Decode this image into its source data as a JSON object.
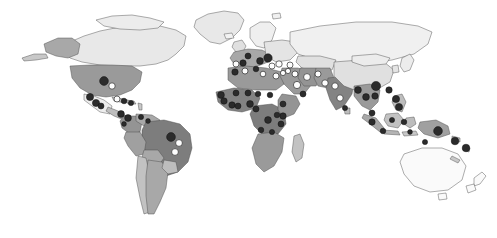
{
  "figure": {
    "type": "choropleth-world-map",
    "title": "",
    "background_color": "#ffffff",
    "width": 497,
    "height": 238,
    "projection": "equirectangular-like",
    "has_legend": false,
    "has_axis_labels": false,
    "has_title_text": false,
    "border_color": "#4a4a4a"
  },
  "chart_data": {
    "type": "map",
    "title": "",
    "xlabel": "",
    "ylabel": "",
    "legend_position": "none",
    "grid": false,
    "choropleth_scale": {
      "name": "grayscale-sequential",
      "steps": [
        {
          "level": 0,
          "label": "no data",
          "color": "#ffffff"
        },
        {
          "level": 1,
          "label": "very low",
          "color": "#e6e6e6"
        },
        {
          "level": 2,
          "label": "low",
          "color": "#d2d2d2"
        },
        {
          "level": 3,
          "label": "medium-low",
          "color": "#bdbdbd"
        },
        {
          "level": 4,
          "label": "medium",
          "color": "#a8a8a8"
        },
        {
          "level": 5,
          "label": "medium-high",
          "color": "#949494"
        },
        {
          "level": 6,
          "label": "high",
          "color": "#808080"
        },
        {
          "level": 7,
          "label": "very high",
          "color": "#6b6b6b"
        }
      ]
    },
    "marker_types": [
      {
        "name": "dark-marker",
        "fill": "#2b2b2b",
        "stroke": "#111111",
        "meaning": "recorded site"
      },
      {
        "name": "light-marker",
        "fill": "#fdfdfd",
        "stroke": "#2b2b2b",
        "meaning": "secondary site"
      }
    ],
    "regions": [
      {
        "name": "Greenland",
        "level": 1
      },
      {
        "name": "Canada",
        "level": 1
      },
      {
        "name": "Alaska",
        "level": 4
      },
      {
        "name": "United States",
        "level": 5
      },
      {
        "name": "Mexico",
        "level": 1
      },
      {
        "name": "Central America",
        "level": 3
      },
      {
        "name": "Caribbean",
        "level": 3
      },
      {
        "name": "Colombia",
        "level": 5
      },
      {
        "name": "Venezuela",
        "level": 4
      },
      {
        "name": "Brazil",
        "level": 6
      },
      {
        "name": "Peru",
        "level": 4
      },
      {
        "name": "Bolivia",
        "level": 4
      },
      {
        "name": "Chile",
        "level": 3
      },
      {
        "name": "Argentina",
        "level": 4
      },
      {
        "name": "Western Europe",
        "level": 4
      },
      {
        "name": "Eastern Europe",
        "level": 1
      },
      {
        "name": "Scandinavia",
        "level": 1
      },
      {
        "name": "Russia",
        "level": 1
      },
      {
        "name": "North Africa",
        "level": 5
      },
      {
        "name": "West Africa",
        "level": 6
      },
      {
        "name": "Central Africa",
        "level": 6
      },
      {
        "name": "East Africa",
        "level": 5
      },
      {
        "name": "Southern Africa",
        "level": 5
      },
      {
        "name": "Madagascar",
        "level": 3
      },
      {
        "name": "Middle East",
        "level": 5
      },
      {
        "name": "Iran",
        "level": 5
      },
      {
        "name": "India",
        "level": 6
      },
      {
        "name": "Pakistan",
        "level": 5
      },
      {
        "name": "China",
        "level": 2
      },
      {
        "name": "Southeast Asia",
        "level": 5
      },
      {
        "name": "Indonesia",
        "level": 5
      },
      {
        "name": "Philippines",
        "level": 4
      },
      {
        "name": "Papua New Guinea",
        "level": 5
      },
      {
        "name": "Australia",
        "level": 0
      },
      {
        "name": "New Zealand",
        "level": 0
      }
    ],
    "markers": [
      {
        "region": "United States",
        "style": "dark",
        "x": 104,
        "y": 81,
        "r": 4.4
      },
      {
        "region": "United States East",
        "style": "light",
        "x": 112,
        "y": 86,
        "r": 3.2
      },
      {
        "region": "Mexico North",
        "style": "dark",
        "x": 90,
        "y": 97,
        "r": 3.6
      },
      {
        "region": "Mexico Central",
        "style": "dark",
        "x": 96,
        "y": 103,
        "r": 3.6
      },
      {
        "region": "Mexico South",
        "style": "dark",
        "x": 101,
        "y": 106,
        "r": 3.0
      },
      {
        "region": "Cuba",
        "style": "light",
        "x": 117,
        "y": 99,
        "r": 3.0
      },
      {
        "region": "Hispaniola",
        "style": "dark",
        "x": 124,
        "y": 101,
        "r": 2.8
      },
      {
        "region": "Caribbean East",
        "style": "dark",
        "x": 131,
        "y": 103,
        "r": 2.6
      },
      {
        "region": "Panama",
        "style": "dark",
        "x": 121,
        "y": 114,
        "r": 3.4
      },
      {
        "region": "Colombia",
        "style": "dark",
        "x": 128,
        "y": 118,
        "r": 3.4
      },
      {
        "region": "Venezuela",
        "style": "dark",
        "x": 141,
        "y": 117,
        "r": 2.6
      },
      {
        "region": "Guyana",
        "style": "dark",
        "x": 148,
        "y": 121,
        "r": 2.4
      },
      {
        "region": "Brazil North",
        "style": "dark",
        "x": 171,
        "y": 137,
        "r": 4.4
      },
      {
        "region": "Brazil Northeast",
        "style": "light",
        "x": 179,
        "y": 143,
        "r": 3.4
      },
      {
        "region": "Brazil Central",
        "style": "light",
        "x": 175,
        "y": 152,
        "r": 3.4
      },
      {
        "region": "Ecuador",
        "style": "dark",
        "x": 124,
        "y": 124,
        "r": 2.4
      },
      {
        "region": "Portugal",
        "style": "light",
        "x": 236,
        "y": 64,
        "r": 3.0
      },
      {
        "region": "Spain",
        "style": "dark",
        "x": 243,
        "y": 63,
        "r": 3.2
      },
      {
        "region": "France",
        "style": "dark",
        "x": 248,
        "y": 56,
        "r": 3.0
      },
      {
        "region": "Italy",
        "style": "dark",
        "x": 260,
        "y": 61,
        "r": 3.4
      },
      {
        "region": "Balkans",
        "style": "dark",
        "x": 268,
        "y": 58,
        "r": 4.2
      },
      {
        "region": "Greece",
        "style": "light",
        "x": 272,
        "y": 66,
        "r": 3.0
      },
      {
        "region": "Turkey West",
        "style": "light",
        "x": 279,
        "y": 64,
        "r": 3.2
      },
      {
        "region": "Turkey East",
        "style": "light",
        "x": 290,
        "y": 65,
        "r": 3.0
      },
      {
        "region": "Morocco",
        "style": "dark",
        "x": 235,
        "y": 72,
        "r": 3.2
      },
      {
        "region": "Algeria",
        "style": "light",
        "x": 245,
        "y": 71,
        "r": 3.0
      },
      {
        "region": "Tunisia",
        "style": "dark",
        "x": 256,
        "y": 69,
        "r": 2.8
      },
      {
        "region": "Libya",
        "style": "light",
        "x": 263,
        "y": 74,
        "r": 2.8
      },
      {
        "region": "Egypt",
        "style": "light",
        "x": 276,
        "y": 76,
        "r": 3.0
      },
      {
        "region": "Israel",
        "style": "light",
        "x": 283,
        "y": 73,
        "r": 2.6
      },
      {
        "region": "Syria",
        "style": "light",
        "x": 288,
        "y": 71,
        "r": 2.6
      },
      {
        "region": "Iraq",
        "style": "light",
        "x": 295,
        "y": 74,
        "r": 3.0
      },
      {
        "region": "Saudi Arabia",
        "style": "light",
        "x": 297,
        "y": 85,
        "r": 3.6
      },
      {
        "region": "Yemen",
        "style": "dark",
        "x": 303,
        "y": 94,
        "r": 3.0
      },
      {
        "region": "Iran",
        "style": "light",
        "x": 307,
        "y": 77,
        "r": 3.4
      },
      {
        "region": "Afghanistan",
        "style": "light",
        "x": 318,
        "y": 74,
        "r": 3.0
      },
      {
        "region": "Pakistan",
        "style": "light",
        "x": 325,
        "y": 83,
        "r": 3.2
      },
      {
        "region": "India North",
        "style": "light",
        "x": 335,
        "y": 86,
        "r": 3.2
      },
      {
        "region": "India South",
        "style": "light",
        "x": 340,
        "y": 98,
        "r": 3.2
      },
      {
        "region": "Sri Lanka",
        "style": "dark",
        "x": 345,
        "y": 108,
        "r": 2.6
      },
      {
        "region": "Senegal",
        "style": "dark",
        "x": 221,
        "y": 95,
        "r": 3.4
      },
      {
        "region": "Guinea",
        "style": "dark",
        "x": 224,
        "y": 101,
        "r": 3.2
      },
      {
        "region": "Ivory Coast",
        "style": "dark",
        "x": 232,
        "y": 105,
        "r": 3.2
      },
      {
        "region": "Ghana",
        "style": "dark",
        "x": 238,
        "y": 106,
        "r": 3.0
      },
      {
        "region": "Nigeria",
        "style": "dark",
        "x": 250,
        "y": 104,
        "r": 3.4
      },
      {
        "region": "Cameroon",
        "style": "dark",
        "x": 256,
        "y": 109,
        "r": 3.0
      },
      {
        "region": "Mali",
        "style": "dark",
        "x": 236,
        "y": 93,
        "r": 3.0
      },
      {
        "region": "Niger",
        "style": "dark",
        "x": 248,
        "y": 93,
        "r": 3.0
      },
      {
        "region": "Chad",
        "style": "dark",
        "x": 258,
        "y": 94,
        "r": 2.8
      },
      {
        "region": "Sudan",
        "style": "dark",
        "x": 270,
        "y": 95,
        "r": 2.8
      },
      {
        "region": "Ethiopia",
        "style": "dark",
        "x": 283,
        "y": 104,
        "r": 3.0
      },
      {
        "region": "Kenya",
        "style": "dark",
        "x": 283,
        "y": 116,
        "r": 3.2
      },
      {
        "region": "Tanzania",
        "style": "dark",
        "x": 281,
        "y": 124,
        "r": 3.0
      },
      {
        "region": "DR Congo",
        "style": "dark",
        "x": 268,
        "y": 120,
        "r": 3.4
      },
      {
        "region": "Uganda",
        "style": "dark",
        "x": 277,
        "y": 115,
        "r": 2.8
      },
      {
        "region": "Angola",
        "style": "dark",
        "x": 261,
        "y": 130,
        "r": 2.8
      },
      {
        "region": "Zambia",
        "style": "dark",
        "x": 272,
        "y": 132,
        "r": 2.6
      },
      {
        "region": "Myanmar",
        "style": "dark",
        "x": 358,
        "y": 90,
        "r": 3.4
      },
      {
        "region": "Thailand",
        "style": "dark",
        "x": 366,
        "y": 97,
        "r": 3.4
      },
      {
        "region": "Vietnam",
        "style": "dark",
        "x": 375,
        "y": 96,
        "r": 3.2
      },
      {
        "region": "China South",
        "style": "dark",
        "x": 376,
        "y": 86,
        "r": 4.6
      },
      {
        "region": "Taiwan",
        "style": "dark",
        "x": 389,
        "y": 90,
        "r": 3.2
      },
      {
        "region": "Philippines North",
        "style": "dark",
        "x": 396,
        "y": 99,
        "r": 3.6
      },
      {
        "region": "Philippines South",
        "style": "dark",
        "x": 399,
        "y": 107,
        "r": 3.6
      },
      {
        "region": "Malaysia",
        "style": "dark",
        "x": 372,
        "y": 113,
        "r": 3.0
      },
      {
        "region": "Sumatra",
        "style": "dark",
        "x": 372,
        "y": 122,
        "r": 3.2
      },
      {
        "region": "Java",
        "style": "dark",
        "x": 383,
        "y": 131,
        "r": 2.8
      },
      {
        "region": "Borneo",
        "style": "dark",
        "x": 392,
        "y": 120,
        "r": 2.6
      },
      {
        "region": "Sulawesi",
        "style": "dark",
        "x": 404,
        "y": 122,
        "r": 2.8
      },
      {
        "region": "Papua New Guinea",
        "style": "dark",
        "x": 438,
        "y": 131,
        "r": 4.4
      },
      {
        "region": "Solomon Islands",
        "style": "dark",
        "x": 455,
        "y": 141,
        "r": 3.8
      },
      {
        "region": "Vanuatu",
        "style": "dark",
        "x": 466,
        "y": 148,
        "r": 3.8
      },
      {
        "region": "New Caledonia",
        "style": "dark",
        "x": 425,
        "y": 142,
        "r": 2.6
      },
      {
        "region": "Timor",
        "style": "dark",
        "x": 410,
        "y": 132,
        "r": 2.4
      }
    ]
  }
}
